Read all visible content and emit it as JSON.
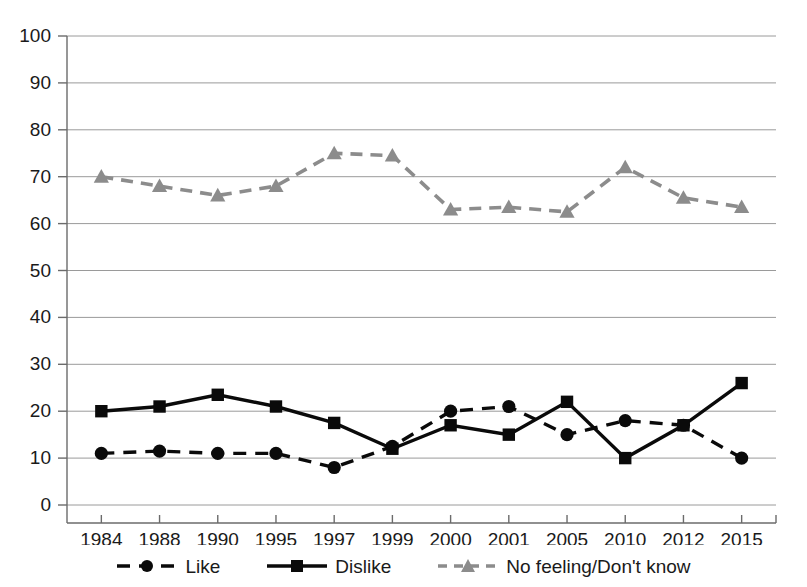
{
  "chart_data": {
    "type": "line",
    "title": "",
    "subtitle": "",
    "xlabel": "",
    "ylabel": "",
    "categories": [
      "1984",
      "1988",
      "1990",
      "1995",
      "1997",
      "1999",
      "2000",
      "2001",
      "2005",
      "2010",
      "2012",
      "2015"
    ],
    "ylim": [
      0,
      100
    ],
    "yticks": [
      "0",
      "10",
      "20",
      "30",
      "40",
      "50",
      "60",
      "70",
      "80",
      "90",
      "100"
    ],
    "grid": "horizontal",
    "legend_position": "bottom",
    "series": [
      {
        "name": "Like",
        "style": "dashed",
        "color": "#0a0a0a",
        "marker": "circle",
        "values": [
          11,
          11.5,
          11,
          11,
          8,
          12.5,
          20,
          21,
          15,
          18,
          17,
          10
        ]
      },
      {
        "name": "Dislike",
        "style": "solid",
        "color": "#0a0a0a",
        "marker": "square",
        "values": [
          20,
          21,
          23.5,
          21,
          17.5,
          12,
          17,
          15,
          22,
          10,
          17,
          26
        ]
      },
      {
        "name": "No feeling/Don't know",
        "style": "dashed",
        "color": "#8c8c8c",
        "marker": "triangle",
        "values": [
          70,
          68,
          66,
          68,
          75,
          74.5,
          63,
          63.5,
          62.5,
          72,
          65.5,
          63.5
        ]
      }
    ]
  },
  "legend": {
    "items": [
      {
        "label": "Like",
        "key": "dashed-circle-key"
      },
      {
        "label": "Dislike",
        "key": "solid-square-key"
      },
      {
        "label": "No feeling/Don't know",
        "key": "gray-dashed-triangle-key"
      }
    ]
  }
}
